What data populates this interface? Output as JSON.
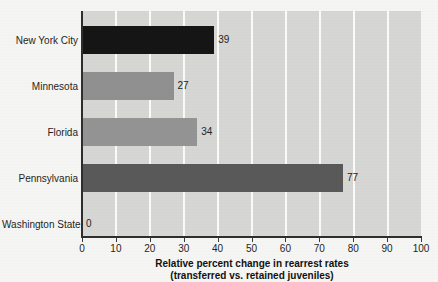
{
  "chart_data": {
    "type": "bar",
    "orientation": "horizontal",
    "title": "",
    "xlabel": "Relative percent change in rearrest rates (transferred vs. retained juveniles)",
    "xlabel_line1": "Relative percent change in rearrest rates",
    "xlabel_line2": "(transferred vs. retained juveniles)",
    "ylabel": "",
    "categories": [
      "New York City",
      "Minnesota",
      "Florida",
      "Pennsylvania",
      "Washington State"
    ],
    "values": [
      39,
      27,
      34,
      77,
      0
    ],
    "value_labels": [
      "39",
      "27",
      "34",
      "77",
      "0"
    ],
    "bar_colors": [
      "#151515",
      "#909090",
      "#949494",
      "#595959",
      "#d6d6d4"
    ],
    "xlim": [
      0,
      100
    ],
    "xticks": [
      0,
      10,
      20,
      30,
      40,
      50,
      60,
      70,
      80,
      90,
      100
    ],
    "xtick_labels": [
      "0",
      "10",
      "20",
      "30",
      "40",
      "50",
      "60",
      "70",
      "80",
      "90",
      "100"
    ],
    "grid": "vertical",
    "gridline_color": "#fbfbfa",
    "plot_background": "#d6d6d4",
    "figure_background": "#f5f5f3",
    "legend": "none"
  }
}
